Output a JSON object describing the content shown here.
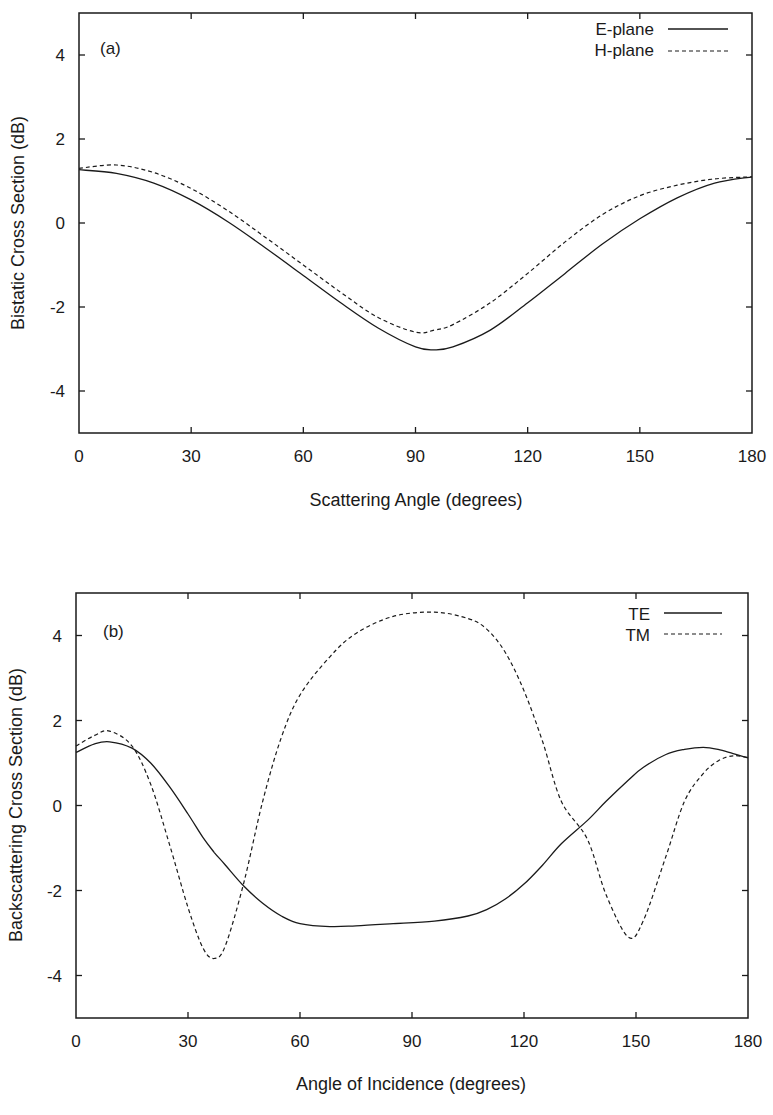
{
  "chart_data": [
    {
      "type": "line",
      "panel_label": "(a)",
      "title": "",
      "xlabel": "Scattering Angle (degrees)",
      "ylabel": "Bistatic Cross Section (dB)",
      "xlim": [
        0,
        180
      ],
      "ylim": [
        -5,
        5
      ],
      "xticks": [
        0,
        30,
        60,
        90,
        120,
        150,
        180
      ],
      "yticks": [
        -4,
        -2,
        0,
        2,
        4
      ],
      "grid": false,
      "legend_position": "upper right",
      "x": [
        0,
        10,
        20,
        30,
        40,
        50,
        60,
        70,
        80,
        90,
        95,
        100,
        110,
        120,
        130,
        140,
        150,
        160,
        170,
        180
      ],
      "series": [
        {
          "name": "E-plane",
          "style": "solid",
          "values": [
            1.27,
            1.18,
            0.95,
            0.55,
            0.02,
            -0.6,
            -1.25,
            -1.9,
            -2.5,
            -2.95,
            -3.02,
            -2.95,
            -2.55,
            -1.9,
            -1.2,
            -0.5,
            0.1,
            0.6,
            0.95,
            1.1
          ]
        },
        {
          "name": "H-plane",
          "style": "dashed",
          "values": [
            1.3,
            1.38,
            1.2,
            0.82,
            0.28,
            -0.35,
            -1.0,
            -1.65,
            -2.25,
            -2.6,
            -2.55,
            -2.42,
            -1.9,
            -1.2,
            -0.45,
            0.2,
            0.65,
            0.9,
            1.05,
            1.1
          ]
        }
      ]
    },
    {
      "type": "line",
      "panel_label": "(b)",
      "title": "",
      "xlabel": "Angle of Incidence (degrees)",
      "ylabel": "Backscattering Cross Section (dB)",
      "xlim": [
        0,
        180
      ],
      "ylim": [
        -5,
        5
      ],
      "xticks": [
        0,
        30,
        60,
        90,
        120,
        150,
        180
      ],
      "yticks": [
        -4,
        -2,
        0,
        2,
        4
      ],
      "grid": false,
      "legend_position": "upper right",
      "x": [
        0,
        5,
        9,
        15,
        20,
        25,
        30,
        34,
        37,
        40,
        45,
        50,
        55,
        60,
        68,
        75,
        85,
        96,
        105,
        110,
        115,
        120,
        125,
        130,
        137,
        142,
        148,
        152,
        158,
        163,
        168,
        172,
        176,
        180
      ],
      "series": [
        {
          "name": "TE",
          "style": "solid",
          "values": [
            1.25,
            1.45,
            1.5,
            1.35,
            1.0,
            0.45,
            -0.2,
            -0.75,
            -1.1,
            -1.4,
            -1.9,
            -2.3,
            -2.6,
            -2.78,
            -2.85,
            -2.83,
            -2.78,
            -2.72,
            -2.6,
            -2.45,
            -2.2,
            -1.85,
            -1.4,
            -0.9,
            -0.35,
            0.1,
            0.6,
            0.9,
            1.2,
            1.32,
            1.37,
            1.32,
            1.22,
            1.12
          ]
        },
        {
          "name": "TM",
          "style": "dashed",
          "values": [
            1.4,
            1.65,
            1.75,
            1.4,
            0.5,
            -0.9,
            -2.4,
            -3.35,
            -3.6,
            -3.3,
            -1.8,
            0.1,
            1.6,
            2.6,
            3.5,
            4.05,
            4.45,
            4.55,
            4.4,
            4.15,
            3.6,
            2.7,
            1.5,
            0.1,
            -0.8,
            -2.1,
            -3.1,
            -2.7,
            -1.2,
            0.1,
            0.75,
            1.05,
            1.17,
            1.13
          ]
        }
      ]
    }
  ],
  "labels": {
    "a": {
      "panel_label": "(a)",
      "xlabel": "Scattering Angle (degrees)",
      "ylabel": "Bistatic Cross Section (dB)",
      "legend": [
        "E-plane",
        "H-plane"
      ]
    },
    "b": {
      "panel_label": "(b)",
      "xlabel": "Angle of Incidence (degrees)",
      "ylabel": "Backscattering Cross Section (dB)",
      "legend": [
        "TE",
        "TM"
      ]
    },
    "xticks": [
      "0",
      "30",
      "60",
      "90",
      "120",
      "150",
      "180"
    ],
    "yticks": [
      "-4",
      "-2",
      "0",
      "2",
      "4"
    ]
  },
  "colors": {
    "line": "#1a1a1a",
    "background": "#ffffff"
  }
}
